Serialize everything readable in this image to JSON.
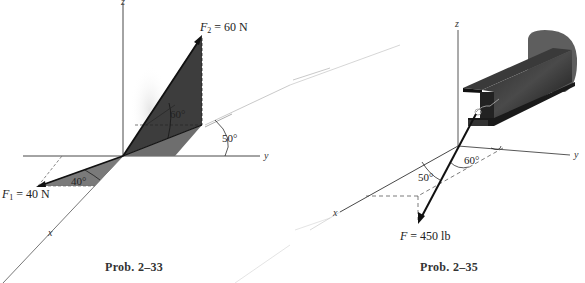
{
  "figures": [
    {
      "id": "prob-2-33",
      "caption": "Prob. 2–33",
      "axes": {
        "x": "x",
        "y": "y",
        "z": "z"
      },
      "forces": [
        {
          "name": "F",
          "subscript": "2",
          "label_rest": " = 60 N",
          "magnitude": "60 N"
        },
        {
          "name": "F",
          "subscript": "1",
          "label_rest": " = 40 N",
          "magnitude": "40 N"
        }
      ],
      "angles": {
        "a60": "60°",
        "a50": "50°",
        "a40": "40°"
      }
    },
    {
      "id": "prob-2-35",
      "caption": "Prob. 2–35",
      "axes": {
        "x": "x",
        "y": "y",
        "z": "z"
      },
      "forces": [
        {
          "name": "F",
          "label_rest": " = 450 lb",
          "magnitude": "450 lb"
        }
      ],
      "angles": {
        "a60": "60°",
        "a50": "50°"
      }
    }
  ],
  "colors": {
    "shade_dark": "#3a3a3a",
    "shade_mid": "#6a6a6a",
    "shade_light": "#8a8a8a",
    "axis": "#333333",
    "beam": "#1a1a1a",
    "wall": "#5a5a5a"
  }
}
